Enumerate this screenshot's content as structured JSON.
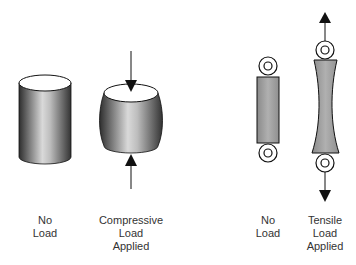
{
  "diagram": {
    "type": "load-deformation-illustration",
    "colors": {
      "outline": "#111111",
      "shade_dark": "#3a3a3a",
      "shade_light": "#d8d8d8",
      "tensile_fill": "#9a9a9a",
      "text": "#333333"
    },
    "panels": [
      {
        "id": "compression-no-load",
        "label_lines": [
          "No",
          "Load"
        ]
      },
      {
        "id": "compression-applied",
        "label_lines": [
          "Compressive",
          "Load",
          "Applied"
        ]
      },
      {
        "id": "tension-no-load",
        "label_lines": [
          "No",
          "Load"
        ]
      },
      {
        "id": "tension-applied",
        "label_lines": [
          "Tensile",
          "Load",
          "Applied"
        ]
      }
    ]
  }
}
